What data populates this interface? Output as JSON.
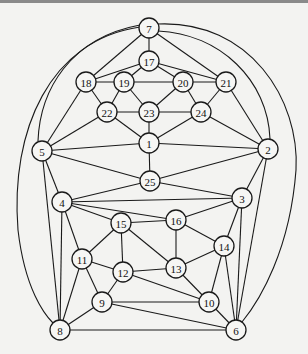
{
  "diagram": {
    "type": "graph",
    "node_radius": 10,
    "nodes": [
      {
        "id": "1",
        "x": 149,
        "y": 143
      },
      {
        "id": "2",
        "x": 268,
        "y": 149
      },
      {
        "id": "3",
        "x": 242,
        "y": 198
      },
      {
        "id": "4",
        "x": 62,
        "y": 202
      },
      {
        "id": "5",
        "x": 42,
        "y": 151
      },
      {
        "id": "6",
        "x": 236,
        "y": 330
      },
      {
        "id": "7",
        "x": 149,
        "y": 28
      },
      {
        "id": "8",
        "x": 60,
        "y": 330
      },
      {
        "id": "9",
        "x": 102,
        "y": 302
      },
      {
        "id": "10",
        "x": 209,
        "y": 302
      },
      {
        "id": "11",
        "x": 82,
        "y": 259
      },
      {
        "id": "12",
        "x": 123,
        "y": 272
      },
      {
        "id": "13",
        "x": 176,
        "y": 268
      },
      {
        "id": "14",
        "x": 224,
        "y": 246
      },
      {
        "id": "15",
        "x": 121,
        "y": 223
      },
      {
        "id": "16",
        "x": 176,
        "y": 220
      },
      {
        "id": "17",
        "x": 149,
        "y": 61
      },
      {
        "id": "18",
        "x": 86,
        "y": 82
      },
      {
        "id": "19",
        "x": 124,
        "y": 82
      },
      {
        "id": "20",
        "x": 183,
        "y": 82
      },
      {
        "id": "21",
        "x": 226,
        "y": 82
      },
      {
        "id": "22",
        "x": 107,
        "y": 112
      },
      {
        "id": "23",
        "x": 149,
        "y": 112
      },
      {
        "id": "24",
        "x": 201,
        "y": 112
      },
      {
        "id": "25",
        "x": 150,
        "y": 181
      }
    ],
    "edges": [
      [
        "7",
        "17"
      ],
      [
        "7",
        "18"
      ],
      [
        "7",
        "21"
      ],
      [
        "17",
        "18"
      ],
      [
        "17",
        "19"
      ],
      [
        "17",
        "20"
      ],
      [
        "17",
        "21"
      ],
      [
        "18",
        "19"
      ],
      [
        "19",
        "20"
      ],
      [
        "20",
        "21"
      ],
      [
        "18",
        "22"
      ],
      [
        "19",
        "22"
      ],
      [
        "19",
        "23"
      ],
      [
        "20",
        "23"
      ],
      [
        "20",
        "24"
      ],
      [
        "21",
        "24"
      ],
      [
        "22",
        "23"
      ],
      [
        "23",
        "24"
      ],
      [
        "22",
        "1"
      ],
      [
        "23",
        "1"
      ],
      [
        "24",
        "1"
      ],
      [
        "18",
        "5"
      ],
      [
        "21",
        "2"
      ],
      [
        "5",
        "22"
      ],
      [
        "2",
        "24"
      ],
      [
        "5",
        "1"
      ],
      [
        "1",
        "2"
      ],
      [
        "1",
        "25"
      ],
      [
        "5",
        "25"
      ],
      [
        "2",
        "25"
      ],
      [
        "4",
        "25"
      ],
      [
        "3",
        "25"
      ],
      [
        "5",
        "4"
      ],
      [
        "2",
        "3"
      ],
      [
        "4",
        "3"
      ],
      [
        "4",
        "15"
      ],
      [
        "4",
        "16"
      ],
      [
        "4",
        "11"
      ],
      [
        "4",
        "8"
      ],
      [
        "5",
        "8"
      ],
      [
        "16",
        "3"
      ],
      [
        "3",
        "14"
      ],
      [
        "3",
        "6"
      ],
      [
        "2",
        "6"
      ],
      [
        "15",
        "16"
      ],
      [
        "15",
        "11"
      ],
      [
        "15",
        "12"
      ],
      [
        "15",
        "13"
      ],
      [
        "16",
        "13"
      ],
      [
        "16",
        "14"
      ],
      [
        "14",
        "13"
      ],
      [
        "14",
        "10"
      ],
      [
        "14",
        "6"
      ],
      [
        "11",
        "12"
      ],
      [
        "11",
        "9"
      ],
      [
        "11",
        "8"
      ],
      [
        "12",
        "13"
      ],
      [
        "12",
        "9"
      ],
      [
        "12",
        "10"
      ],
      [
        "13",
        "10"
      ],
      [
        "9",
        "10"
      ],
      [
        "9",
        "6"
      ],
      [
        "9",
        "8"
      ],
      [
        "10",
        "6"
      ],
      [
        "8",
        "6"
      ]
    ],
    "curved_edges": [
      {
        "from": "7",
        "to": "5",
        "path": "M140,25 C70,38 40,90 38,141"
      },
      {
        "from": "7",
        "to": "8",
        "path": "M140,27 C50,40 10,130 18,230 C25,290 45,315 53,323"
      },
      {
        "from": "7",
        "to": "2",
        "path": "M158,31 C220,34 268,80 270,139"
      },
      {
        "from": "7",
        "to": "6",
        "path": "M158,24 C250,20 300,100 296,170 C290,250 260,300 242,322"
      }
    ]
  }
}
